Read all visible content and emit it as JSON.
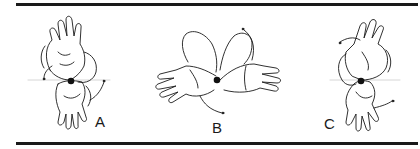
{
  "figure": {
    "panels": [
      {
        "id": "A",
        "label": "A",
        "description": "hand pair rotated, vertical orientation, rotation axis dot at wrist junction"
      },
      {
        "id": "B",
        "label": "B",
        "description": "hand pair spread horizontally with curved rotation arrows"
      },
      {
        "id": "C",
        "label": "C",
        "description": "hand pair rotated, vertical orientation mirrored, rotation axis dot at wrist junction"
      }
    ],
    "colors": {
      "ink": "#1a1a1a",
      "background": "#ffffff",
      "axis_line": "#cccccc"
    }
  }
}
